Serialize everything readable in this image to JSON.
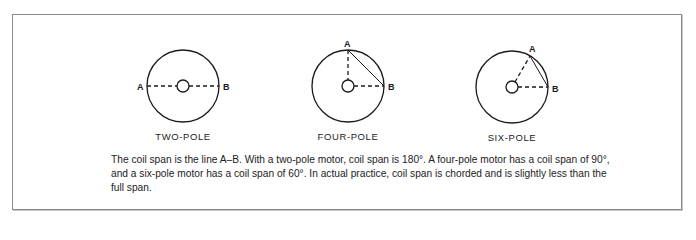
{
  "figure": {
    "panels": [
      {
        "id": "two-pole",
        "title": "TWO-POLE",
        "cx": 183,
        "cy": 86,
        "r": 36,
        "hub_r": 6,
        "point_a_label": "A",
        "point_b_label": "B",
        "coil_span_degrees": 180
      },
      {
        "id": "four-pole",
        "title": "FOUR-POLE",
        "cx": 348,
        "cy": 86,
        "r": 36,
        "hub_r": 6,
        "point_a_label": "A",
        "point_b_label": "B",
        "coil_span_degrees": 90
      },
      {
        "id": "six-pole",
        "title": "SIX-POLE",
        "cx": 512,
        "cy": 87,
        "r": 36,
        "hub_r": 6,
        "point_a_label": "A",
        "point_b_label": "B",
        "coil_span_degrees": 60
      }
    ],
    "caption": "The coil span is the line A–B. With a two-pole motor, coil span is 180°. A four-pole motor has a coil span of 90°, and a six-pole motor has a coil span of 60°. In actual practice, coil span is chorded and is slightly less than the full span.",
    "colors": {
      "stroke": "#1a1a1a",
      "text": "#222222",
      "border": "#8a8a8a"
    }
  }
}
